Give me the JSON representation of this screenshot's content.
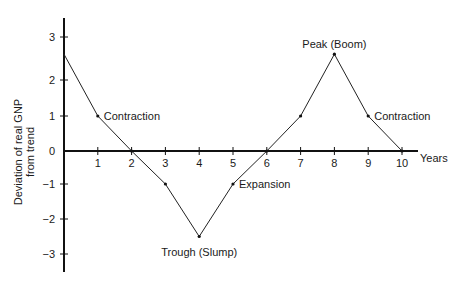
{
  "chart_data": {
    "type": "line",
    "title": "",
    "xlabel": "Years",
    "ylabel_lines": [
      "Deviation of real GNP",
      "from trend"
    ],
    "ylabel": "Deviation of real GNP from trend",
    "x": [
      0,
      1,
      2,
      3,
      4,
      5,
      6,
      7,
      8,
      9,
      10
    ],
    "series": [
      {
        "name": "Business cycle",
        "values": [
          2.6,
          1,
          0,
          -1,
          -2.5,
          -1,
          0,
          1,
          2.6,
          1,
          0
        ]
      }
    ],
    "x_ticks": [
      "1",
      "2",
      "3",
      "4",
      "5",
      "6",
      "7",
      "8",
      "9",
      "10"
    ],
    "y_ticks": [
      "3",
      "2",
      "1",
      "0",
      "−1",
      "−2",
      "−3"
    ],
    "xlim": [
      0,
      10.5
    ],
    "ylim": [
      -3.5,
      3.5
    ],
    "grid": false,
    "legend": null,
    "annotations": [
      {
        "text": "Contraction",
        "x": 1,
        "y": 1
      },
      {
        "text": "Trough (Slump)",
        "x": 4,
        "y": -2.5
      },
      {
        "text": "Expansion",
        "x": 5,
        "y": -1
      },
      {
        "text": "Peak (Boom)",
        "x": 8,
        "y": 2.6
      },
      {
        "text": "Contraction",
        "x": 9,
        "y": 1
      }
    ]
  }
}
